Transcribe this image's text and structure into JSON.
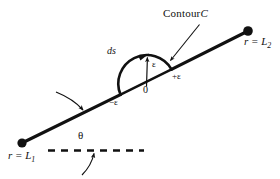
{
  "figure": {
    "background_color": "#ffffff",
    "ink_color": "#111111",
    "labels": {
      "contour": "Contour",
      "contour_symbol": "C",
      "endpoint_right": "r = L",
      "endpoint_right_sub": "2",
      "endpoint_left": "r = L",
      "endpoint_left_sub": "1",
      "arc_element": "ds",
      "radius": "ε",
      "origin": "0",
      "left_limit": "−ε",
      "right_limit": "+ε",
      "angle": "θ"
    },
    "geometry": {
      "line_start": [
        22,
        143
      ],
      "line_end": [
        248,
        31
      ],
      "dot_radius": 4.5,
      "arc_center": [
        146,
        82
      ],
      "arc_radius": 29,
      "arc_start": [
        120,
        95
      ],
      "arc_end": [
        172,
        69
      ],
      "dashed_line_y": 150,
      "dashed_line_x_start": 48,
      "dashed_line_x_end": 143
    }
  }
}
